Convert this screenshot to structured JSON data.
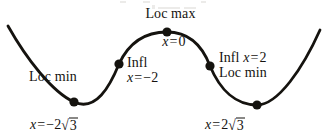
{
  "figure": {
    "type": "calculus-curve-diagram",
    "background_color": "#ffffff",
    "ink_color": "#15130f"
  },
  "labels": {
    "loc_max": "Loc max",
    "max_x": {
      "var": "x",
      "eq": "=",
      "value": "0"
    },
    "loc_min_left": "Loc min",
    "infl_left_title": "Infl",
    "infl_left_x": {
      "var": "x",
      "eq": "=",
      "value": "−2"
    },
    "infl_right": {
      "title": "Infl",
      "var": "x",
      "eq": "=",
      "value": "2"
    },
    "loc_min_right": "Loc min",
    "x_left_min": {
      "var": "x",
      "eq": "=",
      "coef": "−2",
      "radical": "3"
    },
    "x_right_min": {
      "var": "x",
      "eq": "=",
      "coef": "2",
      "radical": "3"
    }
  },
  "chart_data": {
    "type": "line",
    "title": "",
    "xlabel": "",
    "ylabel": "",
    "grid": false,
    "legend": null,
    "axis_shown": false,
    "curve_label": "y = f(x)",
    "points": [
      {
        "name": "local-minimum-left",
        "label": "Loc min",
        "x_expr": "−2√3",
        "x_value": -3.4641,
        "px": 74,
        "py": 102
      },
      {
        "name": "inflection-left",
        "label": "Infl",
        "x_expr": "−2",
        "x_value": -2,
        "px": 119,
        "py": 64
      },
      {
        "name": "local-maximum",
        "label": "Loc max",
        "x_expr": "0",
        "x_value": 0,
        "px": 167,
        "py": 32
      },
      {
        "name": "inflection-right",
        "label": "Infl",
        "x_expr": "2",
        "x_value": 2,
        "px": 210,
        "py": 66
      },
      {
        "name": "local-minimum-right",
        "label": "Loc min",
        "x_expr": "2√3",
        "x_value": 3.4641,
        "px": 257,
        "py": 105
      }
    ],
    "curve_path": "M 8,26 C 26,58 52,92 74,102 C 96,112 110,86 119,64 C 131,38 150,32 167,32 C 185,32 201,42 210,66 C 220,90 236,105 257,105 C 278,105 303,68 320,30",
    "dot_radius_px": 4.6,
    "stroke_width_px": 2.8
  }
}
